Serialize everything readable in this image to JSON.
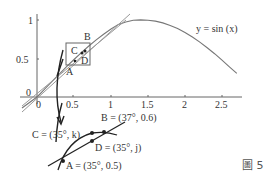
{
  "figure": {
    "caption": "圖 5",
    "curve_label": "y = sin (x)",
    "axes": {
      "x_ticks": [
        "0",
        "0.5",
        "1",
        "1.5",
        "2",
        "2.5"
      ],
      "y_ticks": [
        "0",
        "0.5",
        "1"
      ]
    },
    "main_points": {
      "A": "A",
      "B": "B",
      "C": "C",
      "D": "D"
    },
    "zoom_labels": {
      "A": "A = (35°, 0.5)",
      "B": "B = (37°, 0.6)",
      "C": "C = (35°, k)",
      "D": "D = (35°, j)"
    },
    "colors": {
      "curve": "#777777",
      "tangent": "#888888",
      "axes": "#666666",
      "zoom_curve": "#222222",
      "arrow": "#222222"
    }
  }
}
